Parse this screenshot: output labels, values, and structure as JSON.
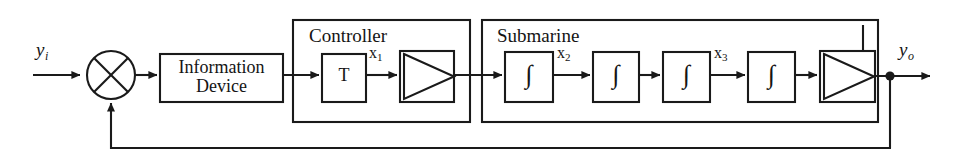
{
  "diagram": {
    "type": "control-system-block-diagram",
    "canvas": {
      "width": 963,
      "height": 163
    },
    "colors": {
      "background": "#ffffff",
      "stroke": "#1a1a1a",
      "text": "#141414"
    }
  },
  "signals": {
    "input_label": "y",
    "input_sub": "i",
    "output_label": "y",
    "output_sub": "o",
    "x1_label": "x",
    "x1_sub": "1",
    "x2_label": "x",
    "x2_sub": "2",
    "x3_label": "x",
    "x3_sub": "3"
  },
  "blocks": {
    "summing_junction": {
      "name": "summing-junction",
      "symbol": "crossed-circle"
    },
    "information_device": {
      "line1": "Information",
      "line2": "Device"
    },
    "transform": {
      "label": "T"
    },
    "gain_controller": {
      "symbol": "triangle-gain"
    },
    "gain_output": {
      "symbol": "triangle-gain"
    },
    "integrator_1": {
      "symbol": "∫"
    },
    "integrator_2": {
      "symbol": "∫"
    },
    "integrator_3": {
      "symbol": "∫"
    },
    "integrator_4": {
      "symbol": "∫"
    }
  },
  "groups": {
    "controller": {
      "title": "Controller"
    },
    "submarine": {
      "title": "Submarine"
    }
  },
  "feedback": {
    "inner_loop": "state feedback from submarine output back to controller input",
    "outer_loop": "output feedback to summing junction"
  }
}
